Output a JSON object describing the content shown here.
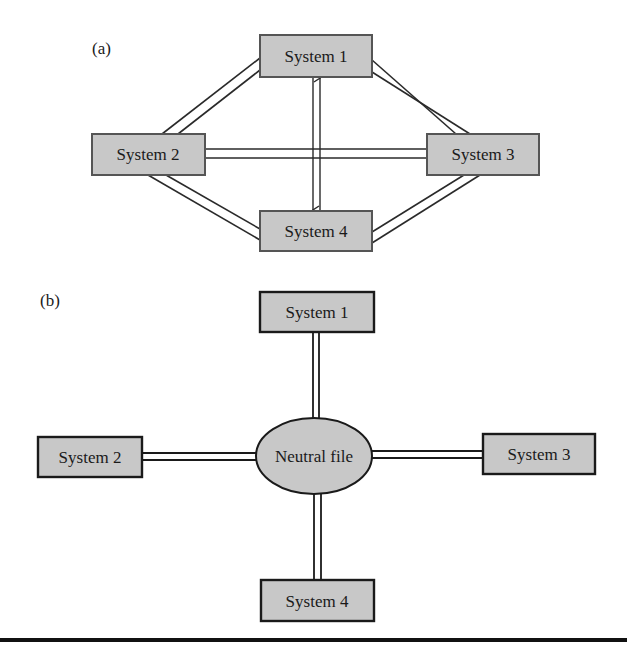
{
  "panel_a": {
    "label": "(a)",
    "nodes": [
      {
        "id": "system1",
        "label": "System 1"
      },
      {
        "id": "system2",
        "label": "System 2"
      },
      {
        "id": "system3",
        "label": "System 3"
      },
      {
        "id": "system4",
        "label": "System 4"
      }
    ],
    "connections": [
      {
        "from": "System 1",
        "to": "System 2",
        "style": "double-line"
      },
      {
        "from": "System 1",
        "to": "System 3",
        "style": "double-line"
      },
      {
        "from": "System 2",
        "to": "System 3",
        "style": "double-line"
      },
      {
        "from": "System 2",
        "to": "System 4",
        "style": "double-line"
      },
      {
        "from": "System 3",
        "to": "System 4",
        "style": "double-line"
      },
      {
        "from": "System 1",
        "to": "System 4",
        "style": "arrow"
      },
      {
        "from": "System 4",
        "to": "System 1",
        "style": "arrow"
      }
    ]
  },
  "panel_b": {
    "label": "(b)",
    "hub": {
      "id": "neutral-file",
      "label": "Neutral file"
    },
    "nodes": [
      {
        "id": "system1",
        "label": "System 1"
      },
      {
        "id": "system2",
        "label": "System 2"
      },
      {
        "id": "system3",
        "label": "System 3"
      },
      {
        "id": "system4",
        "label": "System 4"
      }
    ],
    "connections": [
      {
        "from": "System 1",
        "to": "Neutral file",
        "style": "double-line"
      },
      {
        "from": "System 2",
        "to": "Neutral file",
        "style": "double-line"
      },
      {
        "from": "System 3",
        "to": "Neutral file",
        "style": "double-line"
      },
      {
        "from": "System 4",
        "to": "Neutral file",
        "style": "double-line"
      }
    ]
  },
  "colors": {
    "box_fill": "#c8c8c8",
    "box_border_a": "#555555",
    "box_border_b": "#1a1a1a",
    "line": "#2a2a2a",
    "rule": "#111111"
  }
}
